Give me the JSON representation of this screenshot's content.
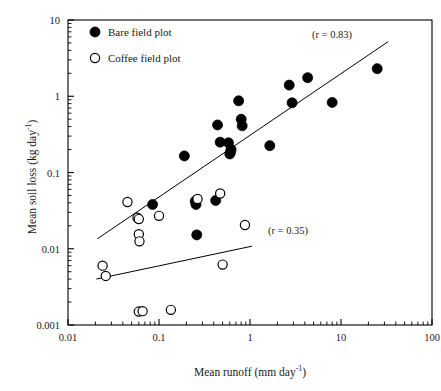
{
  "chart_data": {
    "type": "scatter",
    "title": "",
    "xlabel": "Mean runoff (mm day-1)",
    "ylabel": "Mean soil loss (kg day-1)",
    "xlabel_base": "Mean runoff (mm day",
    "xlabel_sup": "-1",
    "xlabel_tail": ")",
    "ylabel_base": "Mean soil loss (kg day",
    "ylabel_sup": "-1",
    "ylabel_tail": ")",
    "xscale": "log",
    "yscale": "log",
    "xlim": [
      0.01,
      100
    ],
    "ylim": [
      0.001,
      10
    ],
    "grid": false,
    "xticks": [
      0.01,
      0.1,
      1,
      10,
      100
    ],
    "xtick_labels": [
      "0.01",
      "0.1",
      "1",
      "10",
      "100"
    ],
    "yticks": [
      0.001,
      0.01,
      0.1,
      1,
      10
    ],
    "ytick_labels": [
      "0.001",
      "0.01",
      "0.1",
      "1",
      "10"
    ],
    "minor_ticks": true,
    "legend_position": "top-left",
    "series": [
      {
        "name": "Bare field plot",
        "marker": "filled-circle",
        "color": "#000000",
        "r": 0.83,
        "annotation": "(r = 0.83)",
        "points": [
          [
            0.085,
            0.038
          ],
          [
            0.19,
            0.165
          ],
          [
            0.25,
            0.042
          ],
          [
            0.255,
            0.038
          ],
          [
            0.26,
            0.0152
          ],
          [
            0.42,
            0.043
          ],
          [
            0.44,
            0.42
          ],
          [
            0.47,
            0.25
          ],
          [
            0.58,
            0.245
          ],
          [
            0.6,
            0.175
          ],
          [
            0.61,
            0.185
          ],
          [
            0.62,
            0.2
          ],
          [
            0.75,
            0.87
          ],
          [
            0.8,
            0.5
          ],
          [
            0.82,
            0.41
          ],
          [
            1.65,
            0.225
          ],
          [
            2.7,
            1.4
          ],
          [
            2.9,
            0.82
          ],
          [
            4.3,
            1.75
          ],
          [
            8.0,
            0.83
          ],
          [
            25.0,
            2.3
          ]
        ],
        "fit_line": {
          "x1": 0.021,
          "y1": 0.0135,
          "x2": 33.0,
          "y2": 5.2
        }
      },
      {
        "name": "Coffee field plot",
        "marker": "open-circle",
        "color": "#000000",
        "r": 0.35,
        "annotation": "(r = 0.35)",
        "points": [
          [
            0.024,
            0.006
          ],
          [
            0.026,
            0.0044
          ],
          [
            0.045,
            0.041
          ],
          [
            0.058,
            0.0255
          ],
          [
            0.06,
            0.0245
          ],
          [
            0.06,
            0.0155
          ],
          [
            0.061,
            0.0125
          ],
          [
            0.06,
            0.0015
          ],
          [
            0.066,
            0.00152
          ],
          [
            0.1,
            0.027
          ],
          [
            0.135,
            0.00158
          ],
          [
            0.265,
            0.045
          ],
          [
            0.47,
            0.053
          ],
          [
            0.5,
            0.0062
          ],
          [
            0.88,
            0.0205
          ]
        ],
        "fit_line": {
          "x1": 0.0205,
          "y1": 0.004,
          "x2": 1.05,
          "y2": 0.0108
        }
      }
    ]
  },
  "legend": {
    "items": [
      {
        "label": "Bare field plot",
        "marker": "filled-circle"
      },
      {
        "label": "Coffee field plot",
        "marker": "open-circle"
      }
    ]
  }
}
